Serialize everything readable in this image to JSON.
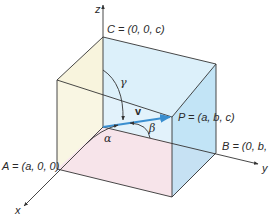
{
  "diagram": {
    "axes": {
      "x": "x",
      "y": "y",
      "z": "z"
    },
    "points": {
      "A": {
        "name": "A",
        "eq": "=",
        "coords": "(a, 0, 0)"
      },
      "B": {
        "name": "B",
        "eq": "=",
        "coords": "(0, b, 0)"
      },
      "C": {
        "name": "C",
        "eq": "=",
        "coords": "(0, 0, c)"
      },
      "P": {
        "name": "P",
        "eq": "=",
        "coords": "(a, b, c)"
      }
    },
    "vector_label": "v",
    "angles": {
      "alpha": "α",
      "beta": "β",
      "gamma": "γ"
    },
    "labels": {
      "A_text": "A = (a, 0, 0)",
      "B_text": "B = (0, b, 0)",
      "C_text": "C = (0, 0, c)",
      "P_text": "P = (a, b, c)"
    },
    "colors": {
      "xz_face": "#f7f3dc",
      "yz_face": "#dcefF9",
      "xy_face": "#f6dde4",
      "right_face": "#bfe3f5",
      "vector": "#3a8fd0",
      "edges": "#333333"
    }
  }
}
